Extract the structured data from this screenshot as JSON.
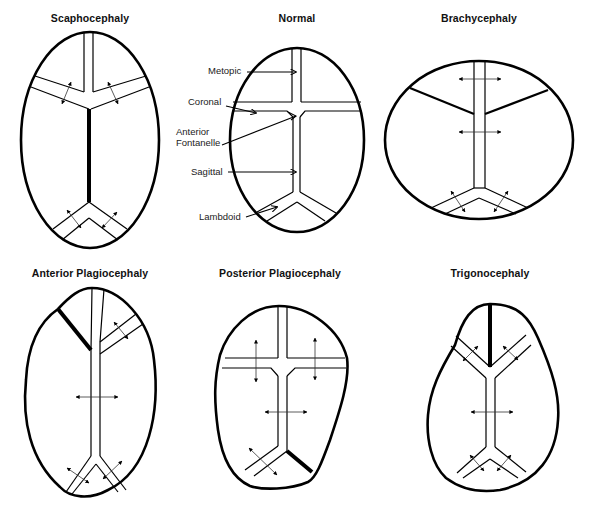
{
  "figure": {
    "panels": [
      {
        "id": "scaphocephaly",
        "title": "Scaphocephaly",
        "fused_suture": "sagittal"
      },
      {
        "id": "normal",
        "title": "Normal",
        "fused_suture": null,
        "labels": [
          {
            "text": "Metopic"
          },
          {
            "text": "Coronal"
          },
          {
            "text": "Anterior"
          },
          {
            "text": "Fontanelle"
          },
          {
            "text": "Sagittal"
          },
          {
            "text": "Lambdoid"
          }
        ]
      },
      {
        "id": "brachycephaly",
        "title": "Brachycephaly",
        "fused_suture": "bilateral coronal"
      },
      {
        "id": "anterior-plagiocephaly",
        "title": "Anterior Plagiocephaly",
        "fused_suture": "unilateral coronal"
      },
      {
        "id": "posterior-plagiocephaly",
        "title": "Posterior Plagiocephaly",
        "fused_suture": "unilateral lambdoid"
      },
      {
        "id": "trigonocephaly",
        "title": "Trigonocephaly",
        "fused_suture": "metopic"
      }
    ],
    "colors": {
      "line": "#000000",
      "background": "#ffffff"
    }
  }
}
